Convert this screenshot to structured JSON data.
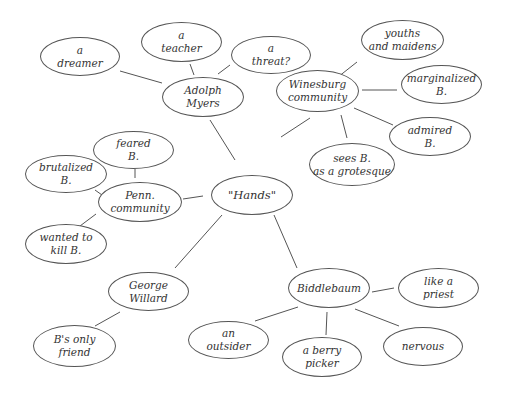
{
  "diagram": {
    "colors": {
      "stroke": "#555555",
      "text": "#333333",
      "background": "#ffffff"
    },
    "nodes": {
      "hands": {
        "lines": [
          "\"Hands\""
        ]
      },
      "adolph": {
        "lines": [
          "Adolph",
          "Myers"
        ]
      },
      "dreamer": {
        "lines": [
          "a",
          "dreamer"
        ]
      },
      "teacher": {
        "lines": [
          "a",
          "teacher"
        ]
      },
      "threat": {
        "lines": [
          "a",
          "threat?"
        ]
      },
      "winesburg": {
        "lines": [
          "Winesburg",
          "community"
        ]
      },
      "youths": {
        "lines": [
          "youths",
          "and maidens"
        ]
      },
      "marginalized": {
        "lines": [
          "marginalized",
          "B."
        ]
      },
      "admired": {
        "lines": [
          "admired",
          "B."
        ]
      },
      "grotesque": {
        "lines": [
          "sees B.",
          "as a grotesque"
        ]
      },
      "penn": {
        "lines": [
          "Penn.",
          "community"
        ]
      },
      "feared": {
        "lines": [
          "feared",
          "B."
        ]
      },
      "brutalized": {
        "lines": [
          "brutalized",
          "B."
        ]
      },
      "wanted": {
        "lines": [
          "wanted to",
          "kill B."
        ]
      },
      "george": {
        "lines": [
          "George",
          "Willard"
        ]
      },
      "onlyfriend": {
        "lines": [
          "B's only",
          "friend"
        ]
      },
      "biddlebaum": {
        "lines": [
          "Biddlebaum"
        ]
      },
      "priest": {
        "lines": [
          "like a",
          "priest"
        ]
      },
      "outsider": {
        "lines": [
          "an",
          "outsider"
        ]
      },
      "berry": {
        "lines": [
          "a berry",
          "picker"
        ]
      },
      "nervous": {
        "lines": [
          "nervous"
        ]
      }
    }
  }
}
